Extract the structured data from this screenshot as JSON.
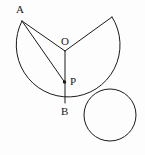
{
  "figure": {
    "background_color": "#fdfdfd",
    "stroke_color": "#1a1a1a",
    "label_color": "#1a1a1a",
    "stroke_width": 1,
    "width": 145,
    "height": 155
  },
  "labels": [
    {
      "id": "A",
      "text": "A",
      "x": 16,
      "y": 4
    },
    {
      "id": "O",
      "text": "O",
      "x": 61,
      "y": 36
    },
    {
      "id": "P",
      "text": "P",
      "x": 70,
      "y": 76
    },
    {
      "id": "B",
      "text": "B",
      "x": 61,
      "y": 106
    }
  ],
  "points": [
    {
      "id": "A",
      "label": "A",
      "x": 22,
      "y": 21,
      "on": "major-circle",
      "dot": false
    },
    {
      "id": "O",
      "label": "O",
      "x": 65,
      "y": 51,
      "on": "center-of-major-circle",
      "dot": false
    },
    {
      "id": "P",
      "label": "P",
      "x": 64.5,
      "y": 82,
      "on": "segment-OB",
      "dot": true
    },
    {
      "id": "B",
      "label": "B",
      "x": 65,
      "y": 103,
      "on": "major-circle-bottom",
      "dot": false
    },
    {
      "id": "E",
      "label": "",
      "x": 112,
      "y": 17,
      "on": "major-circle",
      "dot": false
    }
  ],
  "shapes": {
    "major_arc": {
      "name": "major-arc-A-to-E",
      "center_x": 65,
      "center_y": 51,
      "radius": 52,
      "start_x": 22,
      "start_y": 21,
      "end_x": 112,
      "end_y": 17,
      "sweep": "large-counterclockwise",
      "path": "M 22 21 A 52 52 0 1 0 112 17"
    },
    "small_circle": {
      "name": "tangent-circle",
      "center_x": 110,
      "center_y": 115,
      "radius": 26
    },
    "segments": [
      {
        "name": "radius-O-A",
        "x1": 65,
        "y1": 51,
        "x2": 22,
        "y2": 21
      },
      {
        "name": "radius-O-E",
        "x1": 65,
        "y1": 51,
        "x2": 112,
        "y2": 17
      },
      {
        "name": "radius-O-B",
        "x1": 65,
        "y1": 51,
        "x2": 65,
        "y2": 103
      },
      {
        "name": "chord-A-P",
        "x1": 22,
        "y1": 21,
        "x2": 64.5,
        "y2": 82
      }
    ],
    "dot_radius": 1.7
  }
}
